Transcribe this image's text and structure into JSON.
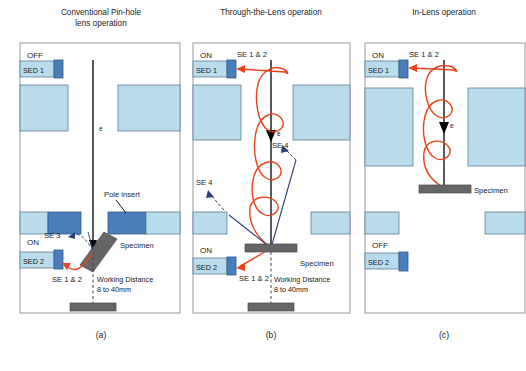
{
  "figure": {
    "width": 526,
    "height": 371,
    "colors": {
      "lens_fill": "#b9dced",
      "lens_stroke": "#5a7f94",
      "pole_insert": "#4a7ebb",
      "detector_body": "#b9dced",
      "detector_cap": "#4a7ebb",
      "specimen": "#666666",
      "stage": "#666666",
      "beam": "#000000",
      "se12_path": "#e8441f",
      "se4_path": "#2b3f73",
      "se3_path": "#2b3f73",
      "panel_border": "#999999",
      "text": "#1a1a1a"
    },
    "panels": [
      {
        "id": "a",
        "caption": "(a)",
        "title_line1": "Conventional Pin-hole",
        "title_line2": "lens operation",
        "sed1_label": "SED 1",
        "sed1_state": "OFF",
        "sed2_label": "SED 2",
        "sed2_state": "ON",
        "beam_label": "e",
        "labels": {
          "pole_insert": "Pole insert",
          "specimen": "Specimen",
          "se3": "SE 3",
          "se12": "SE 1 & 2",
          "working_distance": "Working Distance",
          "working_distance_value": "8 to 40mm"
        }
      },
      {
        "id": "b",
        "caption": "(b)",
        "title_line1": "Through-the-Lens operation",
        "title_line2": "",
        "sed1_label": "SED 1",
        "sed1_state": "ON",
        "sed2_label": "SED 2",
        "sed2_state": "ON",
        "beam_label": "e",
        "labels": {
          "specimen": "Specimen",
          "se12_top": "SE 1 & 2",
          "se12_bottom": "SE 1 & 2",
          "se4_upper": "SE 4",
          "se4_left": "SE 4",
          "working_distance": "Working Distance",
          "working_distance_value": "8 to 40mm"
        }
      },
      {
        "id": "c",
        "caption": "(c)",
        "title_line1": "In-Lens operation",
        "title_line2": "",
        "sed1_label": "SED 1",
        "sed1_state": "ON",
        "sed2_label": "SED 2",
        "sed2_state": "OFF",
        "beam_label": "e",
        "labels": {
          "specimen": "Specimen",
          "se12": "SE 1 & 2"
        }
      }
    ]
  }
}
